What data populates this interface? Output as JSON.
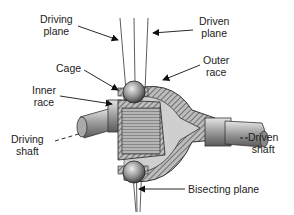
{
  "diagram": {
    "labels": {
      "driving_plane": [
        "Driving",
        "plane"
      ],
      "driven_plane": [
        "Driven",
        "plane"
      ],
      "cage": "Cage",
      "outer_race": [
        "Outer",
        "race"
      ],
      "inner_race": [
        "Inner",
        "race"
      ],
      "driving_shaft": [
        "Driving",
        "shaft"
      ],
      "driven_shaft": [
        "Driven",
        "shaft"
      ],
      "bisecting_plane": "Bisecting plane"
    }
  }
}
